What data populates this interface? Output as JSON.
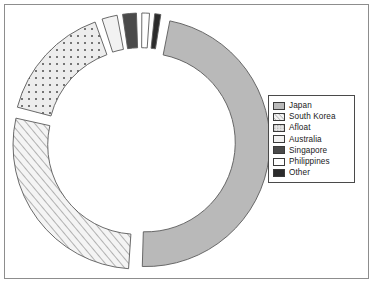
{
  "figure": {
    "background_color": "#ffffff",
    "frame_color": "#8d8d8d"
  },
  "legend": {
    "title": "",
    "position": "right",
    "border_color": "#4a4a4a",
    "entries": [
      {
        "label": "Japan",
        "swatch": "solid-gray-swatch",
        "color": "#b9b9b9",
        "pattern": "solid"
      },
      {
        "label": "South Korea",
        "swatch": "diagonal-hatch-swatch",
        "color": "#efefef",
        "pattern": "diagonal-hatch"
      },
      {
        "label": "Afloat",
        "swatch": "dotted-swatch",
        "color": "#e2e2e2",
        "pattern": "dots"
      },
      {
        "label": "Australia",
        "swatch": "light-gray-swatch",
        "color": "#f2f2f2",
        "pattern": "solid"
      },
      {
        "label": "Singapore",
        "swatch": "dark-gray-swatch",
        "color": "#4a4a4a",
        "pattern": "solid"
      },
      {
        "label": "Philippines",
        "swatch": "white-swatch",
        "color": "#ffffff",
        "pattern": "solid"
      },
      {
        "label": "Other",
        "swatch": "black-swatch",
        "color": "#2b2b2b",
        "pattern": "solid"
      }
    ]
  },
  "chart_data": {
    "type": "pie",
    "variant": "exploded-donut",
    "title": "",
    "subtitle": "",
    "xlabel": "",
    "ylabel": "",
    "grid": false,
    "legend_position": "right",
    "donut_hole_ratio": 0.72,
    "explode_offset_px": 5,
    "start_angle_deg": -80,
    "direction": "clockwise",
    "categories": [
      "Japan",
      "South Korea",
      "Afloat",
      "Australia",
      "Singapore",
      "Philippines",
      "Other"
    ],
    "values": [
      48.0,
      28.0,
      16.0,
      2.6,
      2.4,
      1.6,
      1.4
    ],
    "units": "percent",
    "colors": [
      "#b9b9b9",
      "#efefef",
      "#e2e2e2",
      "#f2f2f2",
      "#4a4a4a",
      "#ffffff",
      "#2b2b2b"
    ],
    "patterns": [
      "solid",
      "diagonal-hatch",
      "dots",
      "solid",
      "solid",
      "solid",
      "solid"
    ],
    "slice_labels_shown": false,
    "edge_color": "#5a5a5a"
  }
}
